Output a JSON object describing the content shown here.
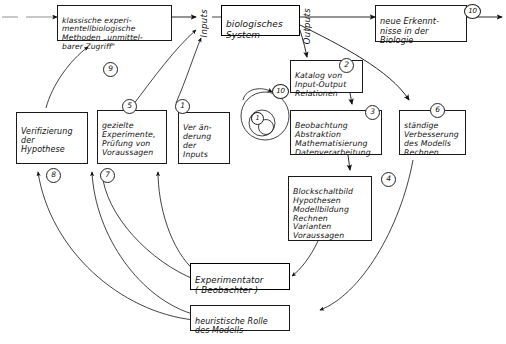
{
  "diagram": {
    "language": "de",
    "style": "hand-drawn flowchart, black ink on white"
  },
  "boxes": {
    "klassische": "klassische experi-\nmentellbiologische\nMethoden „unmittel-\nbarer Zugriff\"",
    "biologisches_system": "biologisches\nSystem",
    "neue_erkenntnisse": "neue Erkennt-\nnisse in der\nBiologie",
    "katalog": "Katalog von\nInput-Output\nRelationen",
    "beobachtung": "Beobachtung\nAbstraktion\nMathematisierung\nDatenverarbeitung",
    "blockschaltbild": "Blockschaltbild\nHypothesen\nModellbildung\nRechnen\nVarianten\nVoraussagen",
    "staendige": "ständige\nVerbesserung\ndes Modells\nRechnen",
    "verifizierung": "Verifizierung\nder\nHypothese",
    "gezielte": "gezielte\nExperimente,\nPrüfung von\nVoraussagen",
    "veraenderung": "Ver än-\nderung\nder\nInputs",
    "experimentator": "Experimentator\n( Beobachter )",
    "heuristische": "heuristische Rolle\ndes Modells"
  },
  "labels": {
    "inputs": "Inputs",
    "outputs": "Outputs"
  },
  "badges": {
    "b1": "1",
    "b2": "2",
    "b3": "3",
    "b4": "4",
    "b5": "5",
    "b6": "6",
    "b7": "7",
    "b8": "8",
    "b9": "9",
    "b10_top": "10",
    "b10_spiral": "10",
    "b1_spiral": "1"
  },
  "colors": {
    "ink": "#111111",
    "paper": "#ffffff",
    "line": "#1a1a1a",
    "thin_line": "#555555"
  }
}
